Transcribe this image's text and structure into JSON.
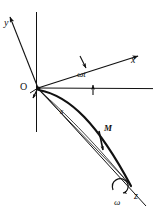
{
  "figure": {
    "kind": "vector-diagram",
    "caption_absent": true,
    "width_px": 154,
    "height_px": 220,
    "background_color": "#ffffff",
    "ink_color": "#111111"
  },
  "labels": {
    "y_axis": "y",
    "x_axis": "x",
    "z_axis": "z",
    "origin": "O",
    "angle": "ωt",
    "arc_length": "s",
    "point_mass": "M",
    "angular_velocity": "ω"
  },
  "geometry": {
    "origin": {
      "x": 38,
      "y": 88
    },
    "y_axis_tip": {
      "x": 8,
      "y": 14
    },
    "x_axis_tip": {
      "x": 141,
      "y": 55
    },
    "z_axis_tip": {
      "x": 146,
      "y": 206
    },
    "horizontal_reference_end": {
      "x": 152,
      "y": 88
    },
    "vertical_line_top": {
      "x": 36,
      "y": 12
    },
    "vertical_line_bottom": {
      "x": 36,
      "y": 132
    },
    "trajectory_end": {
      "x": 131,
      "y": 186
    },
    "point_mass_on_curve": {
      "x": 101,
      "y": 140
    },
    "rotation_marker": {
      "x": 119,
      "y": 187
    }
  },
  "elements": {
    "y_axis_name": "y-axis ray with arrowhead, up and to the left",
    "x_axis_name": "x-axis ray with arrowhead, up and to the right",
    "z_axis_name": "z-axis straight ray to lower right, rotation axis",
    "horizontal_reference_name": "horizontal reference line through origin",
    "vertical_line_name": "vertical construction line through origin",
    "trajectory_name": "thick curved particle trajectory from O to M and beyond",
    "arc_s_name": "thin arc indicating path length s",
    "angle_marker_name": "double arrow angle marker for omega-t",
    "rotation_marker_name": "curved circular arrow about the z-axis"
  }
}
